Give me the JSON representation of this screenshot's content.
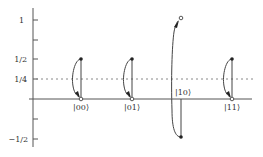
{
  "diagram": {
    "type": "amplitude-inversion-about-mean",
    "y_axis": {
      "ticks": [
        {
          "value": 1,
          "label": "1"
        },
        {
          "value": 0.75,
          "label": ""
        },
        {
          "value": 0.5,
          "label": "1/2"
        },
        {
          "value": 0.25,
          "label": "1/4"
        },
        {
          "value": 0,
          "label": ""
        },
        {
          "value": -0.25,
          "label": ""
        },
        {
          "value": -0.5,
          "label": "−1/2"
        }
      ]
    },
    "mean_line": {
      "value": 0.25,
      "style": "dotted"
    },
    "states": [
      {
        "label": "|00⟩",
        "initial_amplitude": 0.5,
        "final_amplitude": 0
      },
      {
        "label": "|01⟩",
        "initial_amplitude": 0.5,
        "final_amplitude": 0
      },
      {
        "label": "|10⟩",
        "initial_amplitude": -0.5,
        "final_amplitude": 1
      },
      {
        "label": "|11⟩",
        "initial_amplitude": 0.5,
        "final_amplitude": 0
      }
    ],
    "colors": {
      "axis": "#555555",
      "curve": "#444444",
      "dotted": "#888888",
      "text": "#333333"
    }
  }
}
